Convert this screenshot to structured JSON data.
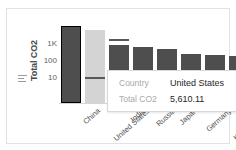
{
  "chart_data": {
    "type": "bar",
    "title": "",
    "xlabel": "Country",
    "ylabel": "Total CO2",
    "yscale": "log",
    "ylim": [
      5,
      10000
    ],
    "ytick_labels": [
      "1K",
      "100",
      "10"
    ],
    "ytick_values": [
      1000,
      100,
      10
    ],
    "grid": false,
    "legend": "none",
    "categories": [
      "China",
      "United States",
      "India",
      "Russia",
      "Japan",
      "Germany",
      "Korea, South",
      "Saudi Arabia",
      "Canada",
      "United Kingdom"
    ],
    "values": [
      11680.42,
      5610.11,
      2442.19,
      1748.46,
      1135.89,
      735.88,
      635.48,
      585.37,
      558.28,
      384.76
    ],
    "series": [
      {
        "name": "Total CO2",
        "values": [
          11680.42,
          5610.11,
          2442.19,
          1748.46,
          1135.89,
          735.88,
          635.48,
          585.37,
          558.28,
          384.76
        ]
      }
    ],
    "selected_category": "United States",
    "highlighted_category": "China"
  },
  "axis": {
    "y_title": "Total CO2",
    "measure_icon": "bar-chart-icon",
    "ticks": [
      {
        "label": "1K",
        "top": 17
      },
      {
        "label": "100",
        "top": 34
      },
      {
        "label": "10",
        "top": 51
      }
    ]
  },
  "bars": [
    {
      "name": "China",
      "left": 2,
      "width": 20,
      "top": 3,
      "state": "highlighted",
      "ref_line": null
    },
    {
      "name": "United States",
      "left": 26,
      "width": 20,
      "top": 7,
      "state": "dimmed",
      "ref_line": 54
    },
    {
      "name": "India",
      "left": 50,
      "width": 20,
      "top": 22,
      "state": "normal",
      "ref_line": 16
    },
    {
      "name": "Russia",
      "left": 74,
      "width": 20,
      "top": 24,
      "state": "normal",
      "ref_line": null
    },
    {
      "name": "Japan",
      "left": 98,
      "width": 20,
      "top": 26,
      "state": "normal",
      "ref_line": null
    },
    {
      "name": "Germany",
      "left": 122,
      "width": 20,
      "top": 31,
      "state": "normal",
      "ref_line": null
    },
    {
      "name": "Korea, South",
      "left": 146,
      "width": 20,
      "top": 32,
      "state": "normal",
      "ref_line": null
    },
    {
      "name": "Saudi Arabia",
      "left": 170,
      "width": 20,
      "top": 33,
      "state": "normal",
      "ref_line": null
    },
    {
      "name": "Canada",
      "left": 194,
      "width": 20,
      "top": 33,
      "state": "normal",
      "ref_line": null
    },
    {
      "name": "United Kingdom",
      "left": 218,
      "width": 20,
      "top": 34,
      "state": "normal",
      "ref_line": null
    }
  ],
  "xlabels": [
    {
      "text": "China",
      "left": 30,
      "top": 3
    },
    {
      "text": "United States",
      "left": 54,
      "top": 3
    },
    {
      "text": "India",
      "left": 78,
      "top": 3
    },
    {
      "text": "Russia",
      "left": 102,
      "top": 3
    },
    {
      "text": "Japan",
      "left": 126,
      "top": 3
    },
    {
      "text": "Germany",
      "left": 150,
      "top": 3
    },
    {
      "text": "Korea, South",
      "left": 174,
      "top": 3
    },
    {
      "text": "Saudi Arabia",
      "left": 198,
      "top": 3
    },
    {
      "text": "Canada",
      "left": 222,
      "top": 3
    },
    {
      "text": "United Kingdom",
      "left": 246,
      "top": 3
    }
  ],
  "tooltip": {
    "rows": [
      {
        "key": "Country",
        "value": "United States"
      },
      {
        "key": "Total CO2",
        "value": "5,610.11"
      }
    ]
  },
  "colors": {
    "bar": "#4e4e4e",
    "bar_dimmed": "#d4d4d4",
    "highlight_border": "#000000",
    "tooltip_bg": "#ffffff",
    "tooltip_key": "#a9a9a9",
    "tooltip_value": "#262626",
    "axis_text": "#4f4f4f"
  }
}
